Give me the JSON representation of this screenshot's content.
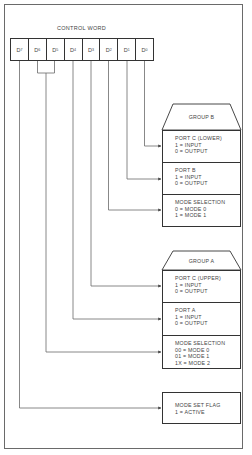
{
  "title": "CONTROL WORD",
  "register": {
    "bits": [
      {
        "base": "D",
        "sub": "7"
      },
      {
        "base": "D",
        "sub": "6"
      },
      {
        "base": "D",
        "sub": "5"
      },
      {
        "base": "D",
        "sub": "4"
      },
      {
        "base": "D",
        "sub": "3"
      },
      {
        "base": "D",
        "sub": "2"
      },
      {
        "base": "D",
        "sub": "1"
      },
      {
        "base": "D",
        "sub": "0"
      }
    ]
  },
  "group_b": {
    "label": "GROUP B",
    "port_c_lower": {
      "title": "PORT C (LOWER)",
      "line1": "1 = INPUT",
      "line2": "0 = OUTPUT"
    },
    "port_b": {
      "title": "PORT B",
      "line1": "1 = INPUT",
      "line2": "0 = OUTPUT"
    },
    "mode_selection": {
      "title": "MODE SELECTION",
      "line1": "0 = MODE 0",
      "line2": "1 = MODE 1"
    }
  },
  "group_a": {
    "label": "GROUP A",
    "port_c_upper": {
      "title": "PORT C (UPPER)",
      "line1": "1 = INPUT",
      "line2": "0 = OUTPUT"
    },
    "port_a": {
      "title": "PORT A",
      "line1": "1 = INPUT",
      "line2": "0 = OUTPUT"
    },
    "mode_selection": {
      "title": "MODE SELECTION",
      "line1": "00 = MODE 0",
      "line2": "01 = MODE 1",
      "line3": "1X = MODE 2"
    }
  },
  "mode_set_flag": {
    "title": "MODE SET FLAG",
    "line1": "1 = ACTIVE"
  },
  "colors": {
    "line": "#555555",
    "border": "#333333",
    "text": "#444444"
  }
}
